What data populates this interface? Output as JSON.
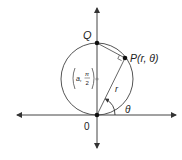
{
  "diagram": {
    "labels": {
      "Q": "Q",
      "P": "P(r, θ)",
      "origin": "0",
      "r": "r",
      "theta": "θ",
      "center_a": "a,",
      "center_pi": "π",
      "center_2": "2"
    },
    "colors": {
      "line": "#444444",
      "circle": "#555555",
      "point": "#111111",
      "center_point": "#888888"
    }
  }
}
